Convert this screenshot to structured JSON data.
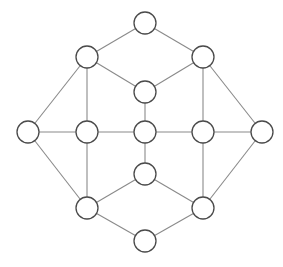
{
  "diagram": {
    "type": "undirected-graph",
    "node_radius": 11,
    "colors": {
      "background": "#ffffff",
      "edge": "#8a8a8a",
      "node_fill": "#ffffff",
      "node_stroke": "#4a4a4a"
    },
    "nodes": [
      {
        "id": "top",
        "x": 145,
        "y": 23
      },
      {
        "id": "upper-left",
        "x": 87,
        "y": 57
      },
      {
        "id": "upper-right",
        "x": 203,
        "y": 57
      },
      {
        "id": "inner-top",
        "x": 145,
        "y": 92
      },
      {
        "id": "left",
        "x": 28,
        "y": 132
      },
      {
        "id": "middle-left",
        "x": 87,
        "y": 132
      },
      {
        "id": "center",
        "x": 145,
        "y": 132
      },
      {
        "id": "middle-right",
        "x": 203,
        "y": 132
      },
      {
        "id": "right",
        "x": 262,
        "y": 132
      },
      {
        "id": "inner-bottom",
        "x": 145,
        "y": 174
      },
      {
        "id": "lower-left",
        "x": 87,
        "y": 208
      },
      {
        "id": "lower-right",
        "x": 203,
        "y": 208
      },
      {
        "id": "bottom",
        "x": 145,
        "y": 241
      }
    ],
    "edges": [
      [
        "top",
        "upper-left"
      ],
      [
        "top",
        "upper-right"
      ],
      [
        "upper-left",
        "inner-top"
      ],
      [
        "upper-right",
        "inner-top"
      ],
      [
        "upper-left",
        "left"
      ],
      [
        "upper-left",
        "middle-left"
      ],
      [
        "upper-right",
        "right"
      ],
      [
        "upper-right",
        "middle-right"
      ],
      [
        "inner-top",
        "center"
      ],
      [
        "left",
        "middle-left"
      ],
      [
        "middle-left",
        "center"
      ],
      [
        "center",
        "middle-right"
      ],
      [
        "middle-right",
        "right"
      ],
      [
        "center",
        "inner-bottom"
      ],
      [
        "left",
        "lower-left"
      ],
      [
        "middle-left",
        "lower-left"
      ],
      [
        "right",
        "lower-right"
      ],
      [
        "middle-right",
        "lower-right"
      ],
      [
        "inner-bottom",
        "lower-left"
      ],
      [
        "inner-bottom",
        "lower-right"
      ],
      [
        "lower-left",
        "bottom"
      ],
      [
        "lower-right",
        "bottom"
      ]
    ]
  }
}
